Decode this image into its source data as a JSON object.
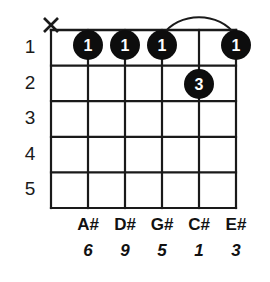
{
  "diagram": {
    "type": "guitar-chord-diagram",
    "colors": {
      "ink": "#1a1a1a",
      "dot_fill": "#0d0d0d",
      "dot_text": "#ffffff",
      "background": "#ffffff"
    },
    "geometry": {
      "string_count": 6,
      "fret_count": 5,
      "grid_left": 51,
      "grid_right": 236,
      "grid_top": 30,
      "grid_bottom": 208,
      "string_spacing": 37,
      "fret_spacing": 35.6,
      "dot_radius": 15
    },
    "fret_numbers": [
      "1",
      "2",
      "3",
      "4",
      "5"
    ],
    "strings": [
      {
        "index": 0,
        "x": 51,
        "note": "",
        "interval": "",
        "marker": "X"
      },
      {
        "index": 1,
        "x": 88,
        "note": "A#",
        "interval": "6",
        "marker": ""
      },
      {
        "index": 2,
        "x": 125,
        "note": "D#",
        "interval": "9",
        "marker": ""
      },
      {
        "index": 3,
        "x": 162,
        "note": "G#",
        "interval": "5",
        "marker": ""
      },
      {
        "index": 4,
        "x": 199,
        "note": "C#",
        "interval": "1",
        "marker": ""
      },
      {
        "index": 5,
        "x": 236,
        "note": "E#",
        "interval": "3",
        "marker": ""
      }
    ],
    "note_names": [
      "A#",
      "D#",
      "G#",
      "C#",
      "E#"
    ],
    "intervals": [
      "6",
      "9",
      "5",
      "1",
      "3"
    ],
    "muted_strings": [
      "X"
    ],
    "fingerings": [
      {
        "string_x": 88,
        "fret": 1,
        "cy": 45,
        "finger": "1"
      },
      {
        "string_x": 125,
        "fret": 1,
        "cy": 45,
        "finger": "1"
      },
      {
        "string_x": 162,
        "fret": 1,
        "cy": 45,
        "finger": "1"
      },
      {
        "string_x": 236,
        "fret": 1,
        "cy": 45,
        "finger": "1"
      },
      {
        "string_x": 199,
        "fret": 2,
        "cy": 84,
        "finger": "3"
      }
    ],
    "barre": {
      "from_x": 162,
      "to_x": 236,
      "peak_y": 17,
      "anchor_y": 36
    },
    "mute_marker": {
      "x": 51,
      "y": 25,
      "size": 7,
      "label": "X"
    }
  }
}
